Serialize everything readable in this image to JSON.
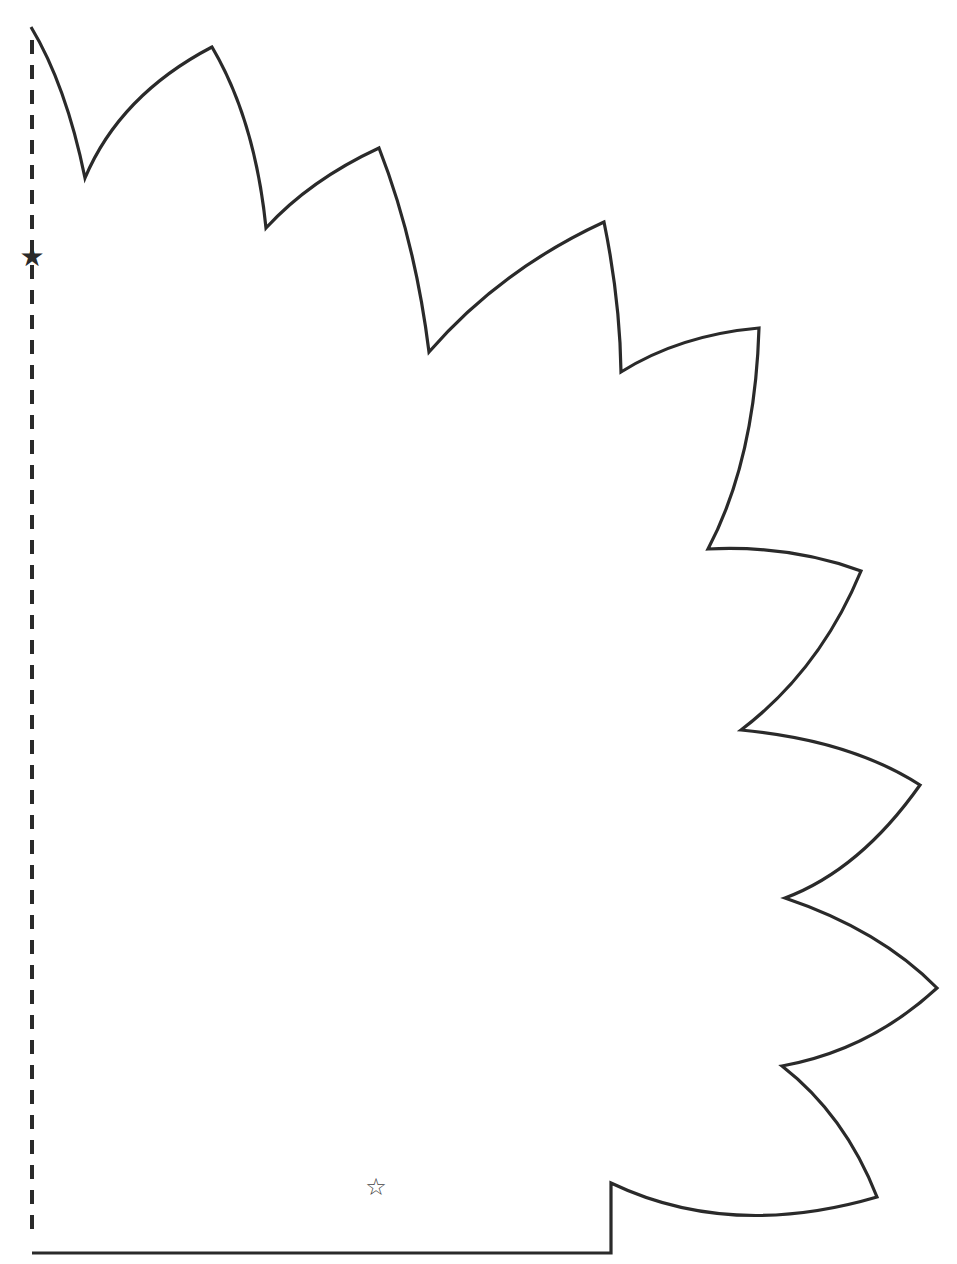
{
  "template": {
    "stroke_color": "#2a2a2a",
    "background": "#ffffff",
    "fold_line": {
      "x": 32,
      "y1": 40,
      "y2": 1240,
      "style": "dashed"
    },
    "fold_marker": {
      "glyph": "★",
      "x": 32,
      "y": 256,
      "meaning": "fold-star"
    },
    "placement_marker": {
      "glyph": "☆",
      "x": 376,
      "y": 1187
    },
    "outline_path": "M 31 27 Q 66 85 85 178 Q 120 95 212 47 Q 255 120 266 228 Q 310 180 379 148 Q 415 240 429 352 Q 500 270 604 222 Q 620 300 621 372 Q 680 335 759 328 Q 755 460 708 549 Q 790 545 861 571 Q 820 670 741 730 Q 850 740 920 785 Q 860 870 785 898 Q 880 930 937 988 Q 870 1050 782 1066 Q 845 1115 877 1197 Q 730 1240 611 1183 L 611 1253 L 32 1253"
  }
}
